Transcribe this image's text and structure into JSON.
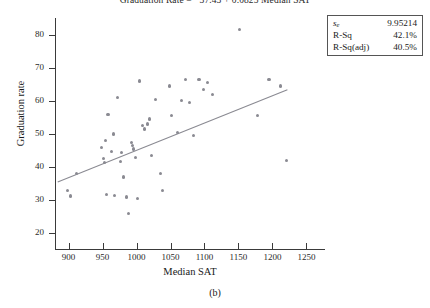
{
  "figure": {
    "caption": "(b)",
    "equation_title": "Graduation Rate = −37.43 + 0.0825 Median SAT"
  },
  "stats_box": {
    "rows": [
      {
        "key": "s",
        "key_sub": "e",
        "value": "9.95214"
      },
      {
        "key": "R-Sq",
        "key_sub": "",
        "value": "42.1%"
      },
      {
        "key": "R-Sq(adj)",
        "key_sub": "",
        "value": "40.5%"
      }
    ]
  },
  "chart_data": {
    "type": "scatter",
    "title": "Graduation Rate = −37.43 + 0.0825 Median SAT",
    "xlabel": "Median SAT",
    "ylabel": "Graduation rate",
    "xlim": [
      880,
      1270
    ],
    "ylim": [
      15,
      85
    ],
    "xticks": [
      900,
      950,
      1000,
      1050,
      1100,
      1150,
      1200,
      1250
    ],
    "yticks": [
      20,
      30,
      40,
      50,
      60,
      70,
      80
    ],
    "grid": false,
    "legend": "none",
    "fit_line": {
      "type": "linear",
      "intercept": -37.43,
      "slope": 0.0825,
      "x_start": 884,
      "x_end": 1222,
      "color": "#8a8a92"
    },
    "annotations": [
      "s_e = 9.95214",
      "R-Sq = 42.1%",
      "R-Sq(adj) = 40.5%"
    ],
    "points": [
      {
        "x": 898,
        "y": 33.0
      },
      {
        "x": 903,
        "y": 31.3
      },
      {
        "x": 912,
        "y": 38.0
      },
      {
        "x": 948,
        "y": 46.0
      },
      {
        "x": 951,
        "y": 42.5
      },
      {
        "x": 953,
        "y": 41.5
      },
      {
        "x": 954,
        "y": 48.0
      },
      {
        "x": 956,
        "y": 31.8
      },
      {
        "x": 958,
        "y": 56.0
      },
      {
        "x": 963,
        "y": 44.8
      },
      {
        "x": 966,
        "y": 50.0
      },
      {
        "x": 968,
        "y": 31.5
      },
      {
        "x": 972,
        "y": 61.0
      },
      {
        "x": 976,
        "y": 41.8
      },
      {
        "x": 978,
        "y": 44.5
      },
      {
        "x": 981,
        "y": 37.0
      },
      {
        "x": 985,
        "y": 31.0
      },
      {
        "x": 988,
        "y": 26.0
      },
      {
        "x": 992,
        "y": 47.5
      },
      {
        "x": 994,
        "y": 46.5
      },
      {
        "x": 996,
        "y": 45.5
      },
      {
        "x": 998,
        "y": 43.0
      },
      {
        "x": 1002,
        "y": 30.5
      },
      {
        "x": 1004,
        "y": 66.0
      },
      {
        "x": 1009,
        "y": 52.5
      },
      {
        "x": 1012,
        "y": 51.5
      },
      {
        "x": 1016,
        "y": 53.0
      },
      {
        "x": 1019,
        "y": 54.5
      },
      {
        "x": 1022,
        "y": 43.5
      },
      {
        "x": 1028,
        "y": 60.5
      },
      {
        "x": 1035,
        "y": 38.0
      },
      {
        "x": 1038,
        "y": 33.0
      },
      {
        "x": 1048,
        "y": 64.5
      },
      {
        "x": 1052,
        "y": 55.5
      },
      {
        "x": 1060,
        "y": 50.5
      },
      {
        "x": 1066,
        "y": 60.0
      },
      {
        "x": 1072,
        "y": 66.5
      },
      {
        "x": 1078,
        "y": 59.5
      },
      {
        "x": 1084,
        "y": 49.5
      },
      {
        "x": 1092,
        "y": 66.5
      },
      {
        "x": 1098,
        "y": 63.5
      },
      {
        "x": 1104,
        "y": 65.5
      },
      {
        "x": 1112,
        "y": 62.0
      },
      {
        "x": 1152,
        "y": 81.5
      },
      {
        "x": 1178,
        "y": 55.5
      },
      {
        "x": 1195,
        "y": 66.5
      },
      {
        "x": 1212,
        "y": 64.5
      },
      {
        "x": 1221,
        "y": 42.0
      }
    ]
  }
}
